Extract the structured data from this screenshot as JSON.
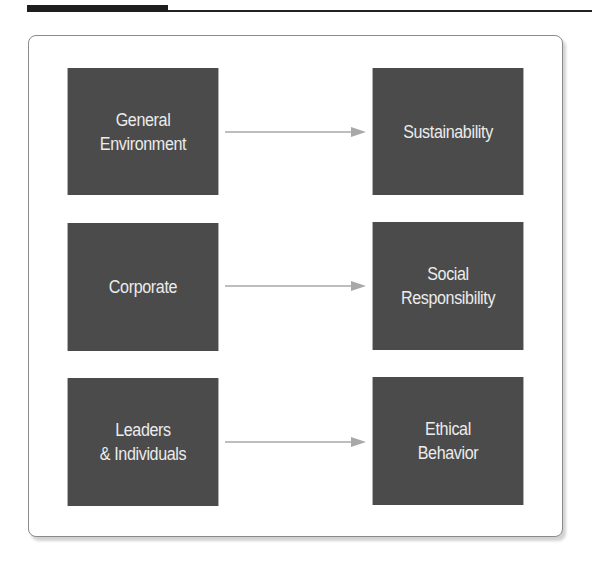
{
  "header": {
    "rule_color": "#222222"
  },
  "diagram": {
    "box_color": "#4b4b4b",
    "text_color": "#ececec",
    "arrow_color": "#a8a8a8",
    "rows": [
      {
        "source": {
          "label": "General\nEnvironment"
        },
        "target": {
          "label": "Sustainability"
        }
      },
      {
        "source": {
          "label": "Corporate"
        },
        "target": {
          "label": "Social\nResponsibility"
        }
      },
      {
        "source": {
          "label": "Leaders\n& Individuals"
        },
        "target": {
          "label": "Ethical\nBehavior"
        }
      }
    ]
  }
}
